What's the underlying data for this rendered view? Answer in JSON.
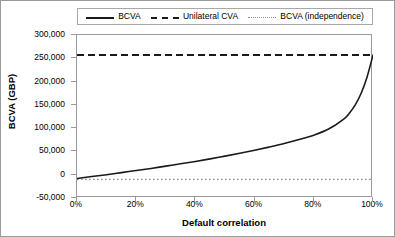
{
  "chart_data": {
    "type": "line",
    "title": "",
    "xlabel": "Default correlation",
    "ylabel": "BCVA (GBP)",
    "xlim": [
      0,
      100
    ],
    "ylim": [
      -50000,
      300000
    ],
    "x_tick_labels": [
      "0%",
      "20%",
      "40%",
      "60%",
      "80%",
      "100%"
    ],
    "x_ticks": [
      0,
      20,
      40,
      60,
      80,
      100
    ],
    "y_tick_labels": [
      "300,000",
      "250,000",
      "200,000",
      "150,000",
      "100,000",
      "50,000",
      "0",
      "-50,000"
    ],
    "y_ticks": [
      300000,
      250000,
      200000,
      150000,
      100000,
      50000,
      0,
      -50000
    ],
    "grid": false,
    "legend_position": "top",
    "x": [
      0,
      5,
      10,
      15,
      20,
      25,
      30,
      35,
      40,
      45,
      50,
      55,
      60,
      65,
      70,
      75,
      80,
      85,
      90,
      92,
      94,
      96,
      98,
      100
    ],
    "series": [
      {
        "name": "BCVA",
        "style": "solid",
        "color": "#1a1a1a",
        "values": [
          -8000,
          -4000,
          0,
          4500,
          9000,
          13500,
          18500,
          23500,
          28500,
          34000,
          40000,
          46000,
          52500,
          59500,
          67000,
          75500,
          85000,
          98000,
          119000,
          132000,
          150000,
          175000,
          210000,
          257000
        ]
      },
      {
        "name": "Unilateral CVA",
        "style": "dashed",
        "color": "#1a1a1a",
        "constant": 257000,
        "values": [
          257000,
          257000,
          257000,
          257000,
          257000,
          257000,
          257000,
          257000,
          257000,
          257000,
          257000,
          257000,
          257000,
          257000,
          257000,
          257000,
          257000,
          257000,
          257000,
          257000,
          257000,
          257000,
          257000,
          257000
        ]
      },
      {
        "name": "BCVA (independence)",
        "style": "dotted",
        "color": "#8c8c8c",
        "constant": -10000,
        "values": [
          -10000,
          -10000,
          -10000,
          -10000,
          -10000,
          -10000,
          -10000,
          -10000,
          -10000,
          -10000,
          -10000,
          -10000,
          -10000,
          -10000,
          -10000,
          -10000,
          -10000,
          -10000,
          -10000,
          -10000,
          -10000,
          -10000,
          -10000,
          -10000
        ]
      }
    ]
  },
  "legend": {
    "entries": [
      {
        "label": "BCVA",
        "style": "solid"
      },
      {
        "label": "Unilateral CVA",
        "style": "dashed"
      },
      {
        "label": "BCVA (independence)",
        "style": "dotted"
      }
    ]
  }
}
